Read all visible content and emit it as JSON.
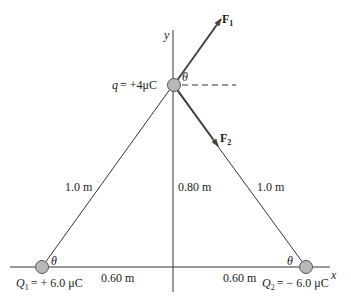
{
  "diagram": {
    "axes": {
      "x_label": "x",
      "y_label": "y"
    },
    "charges": {
      "q": {
        "symbol": "q",
        "value": "= +4μC"
      },
      "Q1": {
        "symbol": "Q",
        "sub": "1",
        "value": "= + 6.0 μC"
      },
      "Q2": {
        "symbol": "Q",
        "sub": "2",
        "value": "= − 6.0 μC"
      }
    },
    "forces": {
      "F1": {
        "symbol": "F",
        "sub": "1"
      },
      "F2": {
        "symbol": "F",
        "sub": "2"
      }
    },
    "angles": {
      "theta": "θ"
    },
    "distances": {
      "left_hyp": "1.0 m",
      "right_hyp": "1.0 m",
      "height": "0.80 m",
      "left_base": "0.60 m",
      "right_base": "0.60 m"
    },
    "colors": {
      "line": "#333333",
      "arrow": "#444444",
      "charge_fill": "#b8b8b8",
      "charge_stroke": "#555555"
    }
  }
}
